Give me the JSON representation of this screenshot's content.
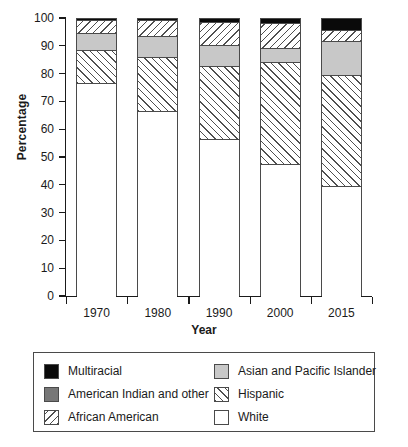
{
  "chart": {
    "ylabel": "Percentage",
    "xlabel": "Year",
    "yticks": [
      "0",
      "10",
      "20",
      "30",
      "40",
      "50",
      "60",
      "70",
      "80",
      "90",
      "100"
    ],
    "xticks": [
      "1970",
      "1980",
      "1990",
      "2000",
      "2015"
    ]
  },
  "legend": {
    "left": [
      {
        "label": "Multiracial",
        "swatch": "multiracial-swatch",
        "style": "sw-multi"
      },
      {
        "label": "American Indian and other",
        "swatch": "american-indian-swatch",
        "style": "sw-amind"
      },
      {
        "label": "African American",
        "swatch": "african-american-swatch",
        "style": "sw-afam"
      }
    ],
    "right": [
      {
        "label": "Asian and Pacific Islander",
        "swatch": "asian-pacific-islander-swatch",
        "style": "sw-asian"
      },
      {
        "label": "Hispanic",
        "swatch": "hispanic-swatch",
        "style": "sw-hisp"
      },
      {
        "label": "White",
        "swatch": "white-swatch",
        "style": "sw-white"
      }
    ]
  },
  "chart_data": {
    "type": "bar",
    "subtype": "stacked-bar-100-percent",
    "title": "",
    "xlabel": "Year",
    "ylabel": "Percentage",
    "ylim": [
      0,
      100
    ],
    "ytick_step": 10,
    "grid": false,
    "legend_position": "below-plot",
    "categories": [
      "1970",
      "1980",
      "1990",
      "2000",
      "2015"
    ],
    "series": [
      {
        "name": "White",
        "color": "#ffffff",
        "pattern": "solid",
        "values": [
          77,
          67,
          57,
          48,
          40
        ]
      },
      {
        "name": "Hispanic",
        "color": "#ffffff",
        "pattern": "forward-hatch",
        "values": [
          12,
          19.5,
          26,
          36.5,
          40
        ]
      },
      {
        "name": "Asian and Pacific Islander",
        "color": "#c8c8c8",
        "pattern": "solid",
        "values": [
          6,
          7.5,
          7.5,
          5,
          12
        ]
      },
      {
        "name": "African American",
        "color": "#ffffff",
        "pattern": "back-hatch",
        "values": [
          4.5,
          5.5,
          8.5,
          9,
          4
        ]
      },
      {
        "name": "Multiracial",
        "color": "#0a0a0a",
        "pattern": "solid",
        "values": [
          0.5,
          0.5,
          1,
          1.5,
          4
        ]
      }
    ],
    "stack_order_bottom_to_top": [
      "White",
      "Hispanic",
      "Asian and Pacific Islander",
      "African American",
      "Multiracial"
    ],
    "cumulative_tops": {
      "1970": [
        77,
        89,
        95,
        99.5,
        100
      ],
      "1980": [
        67,
        86.5,
        94,
        99.5,
        100
      ],
      "1990": [
        57,
        83,
        90.5,
        99,
        100
      ],
      "2000": [
        48,
        84.5,
        89.5,
        98.5,
        100
      ],
      "2015": [
        40,
        80,
        92,
        96,
        100
      ]
    }
  }
}
